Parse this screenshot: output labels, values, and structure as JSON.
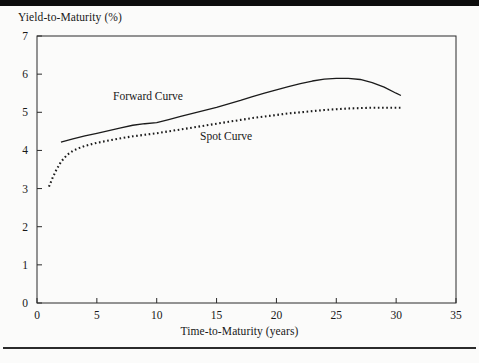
{
  "page": {
    "background_color": "#fbfbfa",
    "top_bar_color": "#0d0d0d",
    "rule_color": "#2b2b2b"
  },
  "chart_data": {
    "type": "line",
    "title": "",
    "xlabel": "Time-to-Maturity (years)",
    "ylabel": "Yield-to-Maturity (%)",
    "xlim": [
      0,
      35
    ],
    "ylim": [
      0,
      7
    ],
    "xticks": [
      0,
      5,
      10,
      15,
      20,
      25,
      30,
      35
    ],
    "xtick_labels": [
      "0",
      "5",
      "10",
      "15",
      "20",
      "25",
      "30",
      "35"
    ],
    "yticks": [
      0,
      1,
      2,
      3,
      4,
      5,
      6,
      7
    ],
    "ytick_labels": [
      "0",
      "1",
      "2",
      "3",
      "4",
      "5",
      "6",
      "7"
    ],
    "grid": false,
    "legend_position": "inline-annotations",
    "series": [
      {
        "name": "Forward Curve",
        "style": "solid",
        "color": "#1b1b1b",
        "annotation": "Forward Curve",
        "x": [
          2,
          3,
          4,
          5,
          6,
          7,
          8,
          9,
          10,
          11,
          12,
          13,
          14,
          15,
          16,
          17,
          18,
          19,
          20,
          21,
          22,
          23,
          24,
          25,
          26,
          27,
          28,
          29,
          30,
          30.4
        ],
        "y": [
          4.22,
          4.3,
          4.38,
          4.45,
          4.52,
          4.59,
          4.66,
          4.7,
          4.73,
          4.81,
          4.89,
          4.97,
          5.05,
          5.13,
          5.22,
          5.31,
          5.41,
          5.5,
          5.59,
          5.67,
          5.75,
          5.82,
          5.87,
          5.89,
          5.89,
          5.86,
          5.78,
          5.66,
          5.5,
          5.44
        ]
      },
      {
        "name": "Spot Curve",
        "style": "dotted",
        "color": "#1b1b1b",
        "annotation": "Spot Curve",
        "x": [
          1,
          1.3,
          1.6,
          2,
          2.5,
          3,
          3.5,
          4,
          5,
          6,
          7,
          8,
          9,
          10,
          11,
          12,
          13,
          14,
          15,
          16,
          17,
          18,
          19,
          20,
          21,
          22,
          23,
          24,
          25,
          26,
          27,
          28,
          29,
          30,
          30.4
        ],
        "y": [
          3.05,
          3.28,
          3.48,
          3.7,
          3.88,
          3.99,
          4.06,
          4.12,
          4.2,
          4.26,
          4.32,
          4.37,
          4.41,
          4.45,
          4.5,
          4.55,
          4.6,
          4.65,
          4.7,
          4.75,
          4.8,
          4.85,
          4.89,
          4.93,
          4.97,
          5.0,
          5.03,
          5.06,
          5.08,
          5.1,
          5.11,
          5.12,
          5.12,
          5.12,
          5.12
        ]
      }
    ]
  },
  "annotations": {
    "forward_label": "Forward Curve",
    "spot_label": "Spot Curve"
  }
}
